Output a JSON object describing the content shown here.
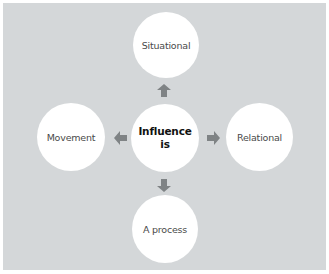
{
  "diagram": {
    "title": "Influence is",
    "center": {
      "line1": "Influence",
      "line2": "is"
    },
    "nodes": {
      "top": "Situational",
      "left": "Movement",
      "right": "Relational",
      "bottom": "A process"
    },
    "colors": {
      "background": "#d4d7d9",
      "circle": "#ffffff",
      "arrow": "#7f8385",
      "text": "#4a4a4a"
    }
  }
}
